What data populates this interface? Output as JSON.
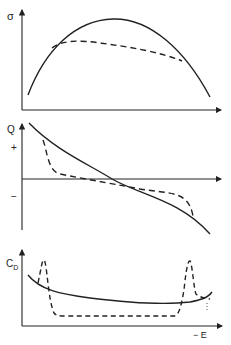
{
  "panels": [
    {
      "name": "sigma-panel",
      "ylabel": "σ",
      "series": [
        "solid",
        "dashed"
      ]
    },
    {
      "name": "charge-panel",
      "ylabel": "Q",
      "plus": "+",
      "minus": "−",
      "series": [
        "solid",
        "dashed"
      ]
    },
    {
      "name": "capacitance-panel",
      "ylabel": "C",
      "ylabel_sub": "D",
      "xlabel": "− E",
      "series": [
        "solid",
        "dashed"
      ]
    }
  ],
  "colors": {
    "line": "#222222",
    "background": "#ffffff"
  }
}
